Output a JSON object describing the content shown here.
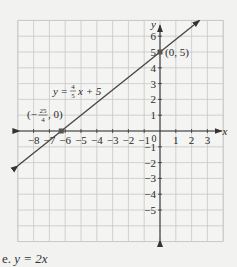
{
  "chart_data": {
    "type": "line",
    "title": "",
    "equation_label": "y = 4/5 x + 5",
    "equation_parts": {
      "y": "y",
      "eq": "=",
      "num": "4",
      "den": "5",
      "rest": "x + 5"
    },
    "xlabel": "x",
    "ylabel": "y",
    "xlim": [
      -9,
      4
    ],
    "ylim": [
      -7,
      7
    ],
    "grid": true,
    "x_ticks": [
      "-8",
      "-7",
      "-6",
      "-5",
      "-4",
      "-3",
      "-2",
      "-1",
      "1",
      "2",
      "3"
    ],
    "y_ticks": [
      "6",
      "5",
      "4",
      "3",
      "2",
      "1",
      "-1",
      "-2",
      "-3",
      "-4",
      "-5"
    ],
    "origin_label": "0",
    "series": [
      {
        "name": "y = (4/5)x + 5",
        "slope": 0.8,
        "intercept": 5,
        "x": [
          -9,
          2.5
        ],
        "y": [
          -2.2,
          7
        ]
      }
    ],
    "points": [
      {
        "label": "(0, 5)",
        "x": 0,
        "y": 5
      },
      {
        "label_num": "25",
        "label_den": "4",
        "label_prefix": "(−",
        "label_suffix": ", 0)",
        "x": -6.25,
        "y": 0
      }
    ],
    "colors": {
      "line": "#444444",
      "grid": "#c8c8c8",
      "point": "#555555"
    }
  },
  "caption": {
    "prefix": "e.",
    "text": "y = 2x"
  }
}
